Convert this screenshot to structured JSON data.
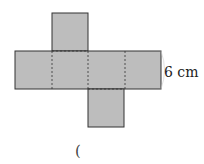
{
  "diagram": {
    "type": "cube-net",
    "fill_color": "#bdbdbd",
    "stroke_color": "#333333",
    "dimension_label": "6 cm",
    "answer_paren": "(",
    "faces": [
      {
        "name": "top",
        "x": 52,
        "y": 13,
        "w": 36,
        "h": 38
      },
      {
        "name": "row-1",
        "x": 15,
        "y": 51,
        "w": 37,
        "h": 38
      },
      {
        "name": "row-2",
        "x": 52,
        "y": 51,
        "w": 36,
        "h": 38
      },
      {
        "name": "row-3",
        "x": 88,
        "y": 51,
        "w": 37,
        "h": 38
      },
      {
        "name": "row-4",
        "x": 125,
        "y": 51,
        "w": 36,
        "h": 38
      },
      {
        "name": "bottom",
        "x": 88,
        "y": 89,
        "w": 36,
        "h": 38
      }
    ]
  }
}
